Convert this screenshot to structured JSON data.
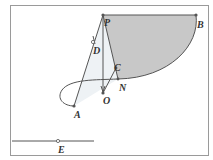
{
  "figure": {
    "points": {
      "P": {
        "label": "P",
        "x": 103,
        "y": 15
      },
      "B": {
        "label": "B",
        "x": 196,
        "y": 15
      },
      "D": {
        "label": "D",
        "x": 93,
        "y": 42
      },
      "C": {
        "label": "C",
        "x": 116,
        "y": 68
      },
      "N": {
        "label": "N",
        "x": 118,
        "y": 79
      },
      "O": {
        "label": "O",
        "x": 103,
        "y": 93
      },
      "A": {
        "label": "A",
        "x": 74,
        "y": 106
      },
      "E": {
        "label": "E",
        "x": 58,
        "y": 141
      }
    },
    "segments": [
      "PB",
      "PA",
      "PO",
      "PN",
      "OC",
      "line through E"
    ],
    "shaded_region": "region bounded by PB, curve B→N, and NP",
    "colors": {
      "shade": "#c8c8c8",
      "light_shade": "#e9eef2",
      "line": "#555555",
      "frame": "#9a9a9a"
    }
  }
}
